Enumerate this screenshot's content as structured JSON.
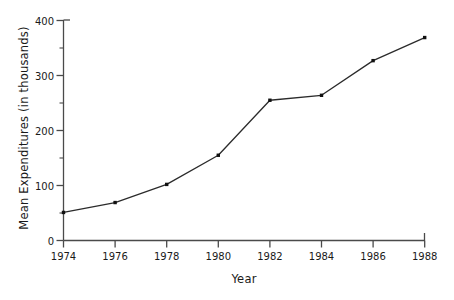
{
  "chart_data": {
    "type": "line",
    "title": "",
    "xlabel": "Year",
    "ylabel": "Mean Expenditures (in thousands)",
    "categories": [
      1974,
      1976,
      1978,
      1980,
      1982,
      1984,
      1986,
      1988
    ],
    "x": [
      1974,
      1976,
      1978,
      1980,
      1982,
      1984,
      1986,
      1988
    ],
    "values": [
      51,
      69,
      102,
      155,
      255,
      264,
      327,
      369
    ],
    "series": [
      {
        "name": "Mean Expenditures",
        "values": [
          51,
          69,
          102,
          155,
          255,
          264,
          327,
          369
        ]
      }
    ],
    "xlim": [
      1974,
      1988
    ],
    "ylim": [
      0,
      400
    ],
    "ytick_labels": [
      "0",
      "100",
      "200",
      "300",
      "400"
    ],
    "ytick_values": [
      0,
      100,
      200,
      300,
      400
    ],
    "yminor_values": [
      50,
      150,
      250,
      350
    ],
    "xtick_labels": [
      "1974",
      "1976",
      "1978",
      "1980",
      "1982",
      "1984",
      "1986",
      "1988"
    ],
    "grid": false,
    "legend": "none",
    "marker": "square",
    "line_color": "#2b2b2b",
    "marker_color": "#111111",
    "axis_color": "#4a4a4a",
    "background_color": "#ffffff"
  }
}
